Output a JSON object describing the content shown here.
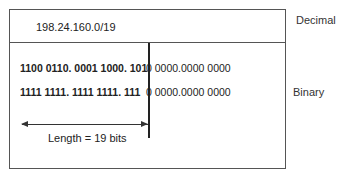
{
  "decimal": {
    "address": "198.24.160.0/19",
    "label": "Decimal"
  },
  "binary": {
    "label": "Binary",
    "rows": [
      {
        "prefix": "1100 0110. 0001 1000. 101",
        "after_line_bold": "",
        "host": "0 0000.0000 0000"
      },
      {
        "prefix": "1111 1111. 1111 1111. 111",
        "after_line_bold": "",
        "host": "0 0000.0000 0000"
      }
    ]
  },
  "length": {
    "label": "Length = 19 bits"
  },
  "colors": {
    "border": "#555555",
    "text": "#222222"
  }
}
